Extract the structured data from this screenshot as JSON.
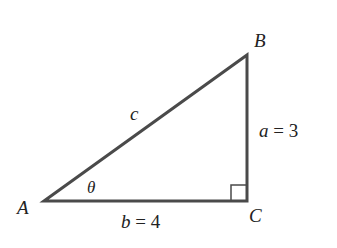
{
  "diagram": {
    "type": "right-triangle",
    "colors": {
      "stroke": "#4a4a4a",
      "text": "#222222",
      "background": "#ffffff"
    },
    "vertices": {
      "A": {
        "label": "A",
        "x": 44,
        "y": 201
      },
      "B": {
        "label": "B",
        "x": 247,
        "y": 55
      },
      "C": {
        "label": "C",
        "x": 247,
        "y": 201
      }
    },
    "sides": {
      "hypotenuse": {
        "label": "c"
      },
      "vertical": {
        "var": "a",
        "eq": " = 3"
      },
      "horizontal": {
        "var": "b",
        "eq": " = 4"
      }
    },
    "angle": {
      "label": "θ",
      "at": "A"
    },
    "right_angle_marker": {
      "at": "C",
      "size": 16
    }
  }
}
